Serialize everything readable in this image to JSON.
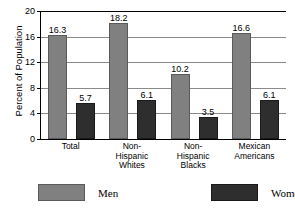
{
  "chart_data": {
    "type": "bar",
    "title": "",
    "subtitle": "",
    "xlabel": "",
    "ylabel": "Percent of Population",
    "ylim": [
      0,
      20
    ],
    "yticks": [
      0,
      4,
      8,
      12,
      16,
      20
    ],
    "ytick_labels": [
      "0",
      "4",
      "8",
      "12",
      "16",
      "20"
    ],
    "grid": "horizontal",
    "legend_position": "bottom",
    "categories": [
      "Total",
      "Non-Hispanic Whites",
      "Non-Hispanic Blacks",
      "Mexican Americans"
    ],
    "category_lines": [
      [
        "Total"
      ],
      [
        "Non-",
        "Hispanic",
        "Whites"
      ],
      [
        "Non-",
        "Hispanic",
        "Blacks"
      ],
      [
        "Mexican",
        "Americans"
      ]
    ],
    "series": [
      {
        "name": "Men",
        "color": "#808080",
        "values": [
          16.3,
          18.2,
          10.2,
          16.6
        ],
        "value_labels": [
          "16.3",
          "18.2",
          "10.2",
          "16.6"
        ]
      },
      {
        "name": "Women",
        "color": "#2e2e2e",
        "values": [
          5.7,
          6.1,
          3.5,
          6.1
        ],
        "value_labels": [
          "5.7",
          "6.1",
          "3.5",
          "6.1"
        ]
      }
    ]
  },
  "legend": {
    "items": [
      {
        "label": "Men",
        "color": "#808080"
      },
      {
        "label": "Women",
        "color": "#2e2e2e"
      }
    ]
  }
}
